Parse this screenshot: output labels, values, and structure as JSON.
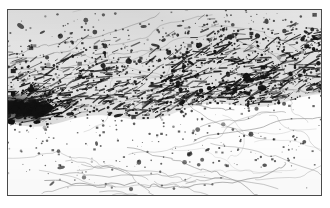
{
  "figure": {
    "domain": "natural-image",
    "kind": "scanned-halftone-plate",
    "width": 330,
    "height": 208,
    "has_text": false,
    "has_axes": false,
    "has_legend": false,
    "caption": "",
    "title": ""
  },
  "page": {
    "background_color": "#ffffff",
    "margin_left": 7,
    "margin_top": 9,
    "margin_right": 8,
    "margin_bottom": 12
  },
  "frame": {
    "label": "plate-border",
    "x": 7,
    "y": 9,
    "width": 315,
    "height": 187,
    "stroke_color": "#4a4a4a",
    "stroke_width": 1,
    "fill_color": "#fdfdfd"
  },
  "palette": {
    "paper": "#ffffff",
    "plate_ground": "#fdfdfd",
    "ink_black": "#111111",
    "ink_dark": "#2b2b2b",
    "ink_mid": "#5e5e5e",
    "ink_light": "#9a9a9a",
    "line_gray": "#8d8d8d",
    "frame": "#4a4a4a"
  },
  "regions": [
    {
      "name": "upper-sparse-field",
      "note": "Top strip: light ground, medium scatter of small black dots, a few thin gray meandering contour lines.",
      "x": 0,
      "y": 0,
      "width": 315,
      "height": 46,
      "density": 0.22,
      "tone": "light"
    },
    {
      "name": "dense-diagonal-band",
      "note": "Broad dark band of fine directional streaks running from lower-left to upper-right; heaviest concentration of ink.",
      "x": 0,
      "y": 40,
      "width": 315,
      "height": 72,
      "density": 0.78,
      "tone": "dark",
      "streak_angle_deg": -18
    },
    {
      "name": "left-dark-blob",
      "note": "Very dark solid concentration hugging the left border near mid-height.",
      "x": 0,
      "y": 86,
      "width": 46,
      "height": 26,
      "density": 0.95,
      "tone": "very-dark"
    },
    {
      "name": "upper-right-streak-mass",
      "note": "Strongly directional diagonal streaking, fibrous texture, upper-right quadrant.",
      "x": 150,
      "y": 30,
      "width": 165,
      "height": 66,
      "density": 0.7,
      "tone": "dark",
      "streak_angle_deg": -22
    },
    {
      "name": "transition-edge",
      "note": "Diagonal boundary where dense band gives way to sparse field; lower at left (~y=112), higher at right (~y=96).",
      "x": 0,
      "y": 96,
      "width": 315,
      "height": 24,
      "density": 0.45,
      "tone": "mid"
    },
    {
      "name": "lower-sparse-field",
      "note": "Bottom third: white ground with isolated black dots and blobs plus faint thin gray curvilinear vein/contour lines.",
      "x": 0,
      "y": 116,
      "width": 315,
      "height": 71,
      "density": 0.16,
      "tone": "light"
    },
    {
      "name": "lower-right-patch",
      "note": "Small cluster of heavier speckle and a short dark streak in the lower-right quadrant.",
      "x": 195,
      "y": 124,
      "width": 105,
      "height": 34,
      "density": 0.34,
      "tone": "mid"
    }
  ],
  "texture": {
    "type": "stipple-speckle",
    "dot_count": 2600,
    "dot_size_min_px": 0.6,
    "dot_size_max_px": 5.0,
    "blob_count": 150,
    "contour_line_count": 46,
    "contour_stroke_color": "#8d8d8d",
    "contour_stroke_width": 0.55,
    "streak_count": 900,
    "random_seed": 20250317
  }
}
